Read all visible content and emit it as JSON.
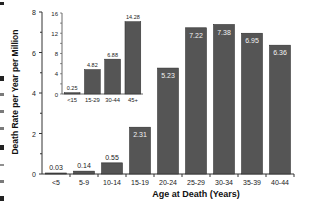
{
  "chart_data": [
    {
      "type": "bar",
      "title": "",
      "xlabel": "Age at Death (Years)",
      "ylabel": "Death Rate per Year per Million",
      "categories": [
        "<5",
        "5-9",
        "10-14",
        "15-19",
        "20-24",
        "25-29",
        "30-34",
        "35-39",
        "40-44"
      ],
      "values": [
        0.03,
        0.14,
        0.55,
        2.31,
        5.23,
        7.22,
        7.38,
        6.95,
        6.36
      ],
      "data_labels": [
        "0.03",
        "0.14",
        "0.55",
        "2.31",
        "5.23",
        "7.22",
        "7.38",
        "6.95",
        "6.36"
      ],
      "yticks": [
        "0",
        "2",
        "4",
        "6",
        "8"
      ],
      "ylim": [
        0,
        8
      ],
      "grid": false,
      "legend": "none",
      "bar_color": "#555555"
    },
    {
      "type": "bar",
      "title": "",
      "xlabel": "",
      "ylabel": "",
      "categories": [
        "<15",
        "15-29",
        "30-44",
        "45+"
      ],
      "values": [
        0.25,
        4.82,
        6.88,
        14.28
      ],
      "data_labels": [
        "0.25",
        "4.82",
        "6.88",
        "14.28"
      ],
      "yticks": [
        "0",
        "4",
        "8",
        "12",
        "16"
      ],
      "ylim": [
        0,
        16
      ],
      "grid": false,
      "legend": "none",
      "bar_color": "#555555",
      "position": "inset-top-left"
    }
  ]
}
